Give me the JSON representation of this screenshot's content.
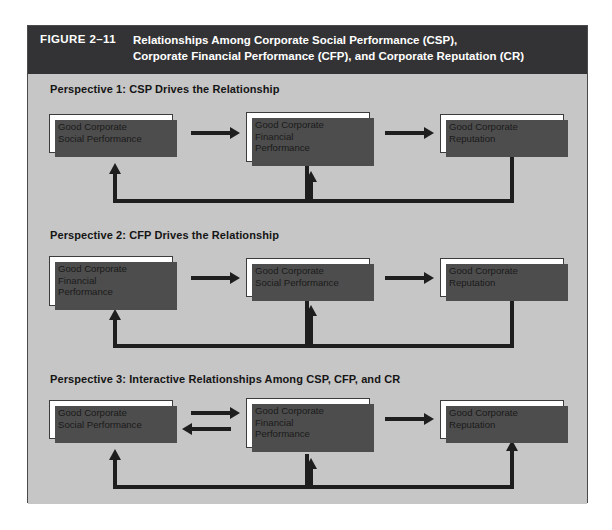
{
  "figure": {
    "number": "FIGURE 2–11",
    "title_line1": "Relationships Among Corporate Social Performance (CSP),",
    "title_line2": "Corporate Financial Performance (CFP), and Corporate Reputation (CR)",
    "header_bg": "#333335",
    "body_bg": "#c6c6c6",
    "box_bg": "#ffffff",
    "line_color": "#1e1e1e",
    "shadow_color": "#4d4d4d"
  },
  "perspectives": [
    {
      "title": "Perspective 1: CSP Drives the Relationship",
      "nodes": [
        {
          "line1": "Good Corporate",
          "line2": "Social Performance",
          "line3": ""
        },
        {
          "line1": "Good Corporate",
          "line2": "Financial",
          "line3": "Performance"
        },
        {
          "line1": "Good Corporate",
          "line2": "Reputation",
          "line3": ""
        }
      ],
      "connectors": [
        {
          "kind": "arrow-right",
          "from": "node1",
          "to": "node2"
        },
        {
          "kind": "arrow-right",
          "from": "node2",
          "to": "node3"
        },
        {
          "kind": "feedback-up",
          "from": "node2",
          "to": "node1"
        },
        {
          "kind": "feedback-up",
          "from": "node3",
          "to": "node2"
        }
      ]
    },
    {
      "title": "Perspective 2: CFP Drives the Relationship",
      "nodes": [
        {
          "line1": "Good Corporate",
          "line2": "Financial",
          "line3": "Performance"
        },
        {
          "line1": "Good Corporate",
          "line2": "Social Performance",
          "line3": ""
        },
        {
          "line1": "Good Corporate",
          "line2": "Reputation",
          "line3": ""
        }
      ],
      "connectors": [
        {
          "kind": "arrow-right",
          "from": "node1",
          "to": "node2"
        },
        {
          "kind": "arrow-right",
          "from": "node2",
          "to": "node3"
        },
        {
          "kind": "feedback-up",
          "from": "node2",
          "to": "node1"
        },
        {
          "kind": "feedback-up",
          "from": "node3",
          "to": "node2"
        }
      ]
    },
    {
      "title": "Perspective 3: Interactive Relationships Among CSP, CFP, and CR",
      "nodes": [
        {
          "line1": "Good Corporate",
          "line2": "Social Performance",
          "line3": ""
        },
        {
          "line1": "Good Corporate",
          "line2": "Financial",
          "line3": "Performance"
        },
        {
          "line1": "Good Corporate",
          "line2": "Reputation",
          "line3": ""
        }
      ],
      "connectors": [
        {
          "kind": "arrow-right",
          "from": "node1",
          "to": "node2"
        },
        {
          "kind": "arrow-left",
          "from": "node2",
          "to": "node1"
        },
        {
          "kind": "arrow-right",
          "from": "node2",
          "to": "node3"
        },
        {
          "kind": "feedback-up",
          "from": "node2",
          "to": "node1"
        },
        {
          "kind": "feedback-up",
          "from": "node3",
          "to": "node2"
        },
        {
          "kind": "feedback-up",
          "from": "node2",
          "to": "node3"
        }
      ]
    }
  ]
}
